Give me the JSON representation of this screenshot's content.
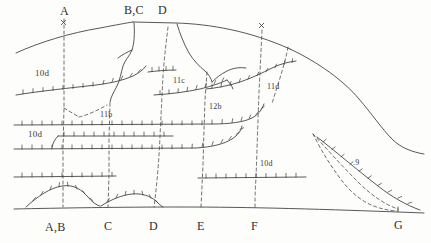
{
  "figure": {
    "kind": "geologic-cross-section-sketch",
    "ink_color": "#3a3a3a",
    "dash_color": "#4a4a4a",
    "background": "#fdfdfc"
  },
  "top_labels": [
    {
      "id": "A",
      "text": "A",
      "x": 60,
      "y": 6
    },
    {
      "id": "BC",
      "text": "B,C",
      "x": 127,
      "y": 5
    },
    {
      "id": "D",
      "text": "D",
      "x": 159,
      "y": 5
    }
  ],
  "bottom_labels": [
    {
      "id": "AB",
      "text": "A,B",
      "x": 48,
      "y": 222
    },
    {
      "id": "C",
      "text": "C",
      "x": 104,
      "y": 221
    },
    {
      "id": "D",
      "text": "D",
      "x": 150,
      "y": 221
    },
    {
      "id": "E",
      "text": "E",
      "x": 197,
      "y": 221
    },
    {
      "id": "F",
      "text": "F",
      "x": 252,
      "y": 221
    },
    {
      "id": "G",
      "text": "G",
      "x": 396,
      "y": 220
    }
  ],
  "unit_labels": [
    {
      "id": "u10d-upper",
      "text": "10d",
      "x": 38,
      "y": 70
    },
    {
      "id": "u11b",
      "text": "11b",
      "x": 101,
      "y": 112
    },
    {
      "id": "u11c",
      "text": "11c",
      "x": 174,
      "y": 78
    },
    {
      "id": "u12b",
      "text": "12b",
      "x": 210,
      "y": 104
    },
    {
      "id": "u11d",
      "text": "11d",
      "x": 268,
      "y": 84
    },
    {
      "id": "u10d-left",
      "text": "10d",
      "x": 30,
      "y": 131
    },
    {
      "id": "u10d-right",
      "text": "10d",
      "x": 261,
      "y": 161
    },
    {
      "id": "u9",
      "text": ".9",
      "x": 354,
      "y": 160
    }
  ],
  "section_lines": {
    "hatched_bed_count": 9,
    "datum_label": "ground-surface",
    "vertical_section_markers": [
      "A",
      "B,C",
      "D",
      "E",
      "F",
      "G"
    ]
  }
}
